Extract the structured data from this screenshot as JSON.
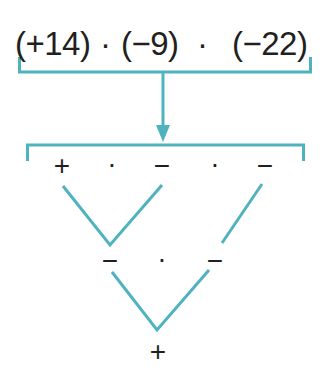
{
  "expression": {
    "factors": [
      "(+14)",
      "(−9)",
      "(−22)"
    ],
    "operator": "·"
  },
  "colors": {
    "bracket": "#4fb3bf",
    "text": "#231f20"
  },
  "level1": {
    "signs": [
      "+",
      "·",
      "−",
      "·",
      "−"
    ]
  },
  "level2": {
    "signs": [
      "−",
      "·",
      "−"
    ]
  },
  "result": {
    "sign": "+"
  }
}
